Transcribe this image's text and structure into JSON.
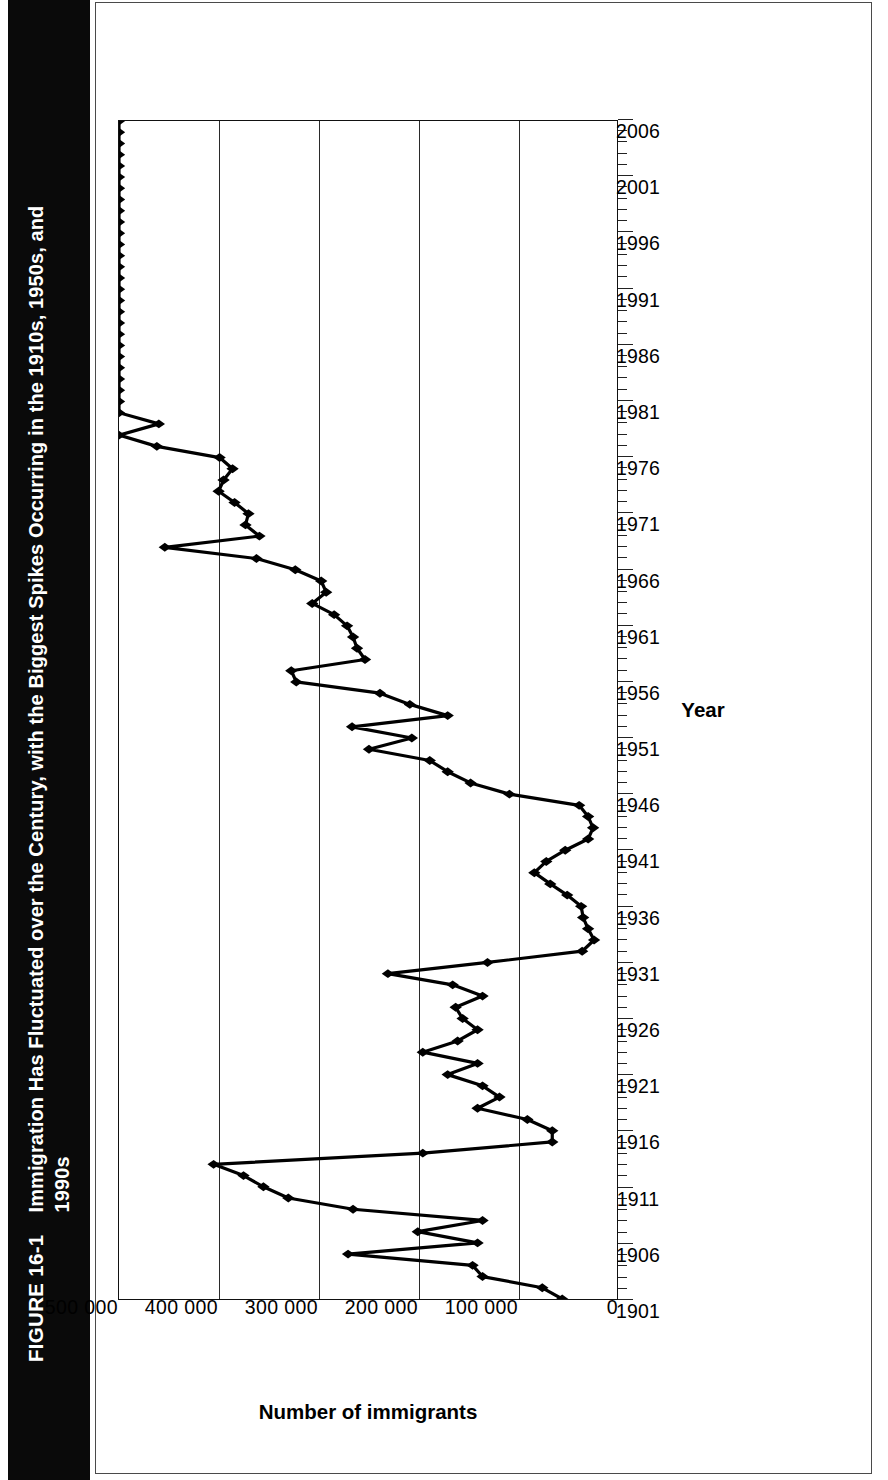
{
  "figure": {
    "number": "FIGURE 16-1",
    "title": "Immigration Has Fluctuated over the Century, with the Biggest Spikes Occurring in the 1910s, 1950s, and 1990s",
    "band_color": "#0a0a0a",
    "band_text_color": "#ffffff"
  },
  "chart_data": {
    "type": "line",
    "title": "Immigration Has Fluctuated over the Century, with the Biggest Spikes Occurring in the 1910s, 1950s, and 1990s",
    "xlabel": "Year",
    "ylabel": "Number of immigrants",
    "xlim": [
      1901,
      2006
    ],
    "ylim": [
      0,
      500000
    ],
    "grid": "horizontal-value-gridlines",
    "legend": "none",
    "marker": "filled-diamond",
    "line_color": "#000000",
    "y_ticks": [
      0,
      100000,
      200000,
      300000,
      400000,
      500000
    ],
    "y_tick_labels": [
      "0",
      "100 000",
      "200 000",
      "300 000",
      "400 000",
      "500 000"
    ],
    "x_tick_labels": [
      "1901",
      "1906",
      "1911",
      "1916",
      "1921",
      "1926",
      "1931",
      "1936",
      "1941",
      "1946",
      "1951",
      "1956",
      "1961",
      "1966",
      "1971",
      "1976",
      "1981",
      "1986",
      "1991",
      "1996",
      "2001",
      "2006"
    ],
    "x_tick_step": 5,
    "x_minor_tick_step": 1,
    "series": [
      {
        "name": "Number of immigrants",
        "x": [
          1901,
          1902,
          1903,
          1904,
          1905,
          1906,
          1907,
          1908,
          1909,
          1910,
          1911,
          1912,
          1913,
          1914,
          1915,
          1916,
          1917,
          1918,
          1919,
          1920,
          1921,
          1922,
          1923,
          1924,
          1925,
          1926,
          1927,
          1928,
          1929,
          1930,
          1931,
          1932,
          1933,
          1934,
          1935,
          1936,
          1937,
          1938,
          1939,
          1940,
          1941,
          1942,
          1943,
          1944,
          1945,
          1946,
          1947,
          1948,
          1949,
          1950,
          1951,
          1952,
          1953,
          1954,
          1955,
          1956,
          1957,
          1958,
          1959,
          1960,
          1961,
          1962,
          1963,
          1964,
          1965,
          1966,
          1967,
          1968,
          1969,
          1970,
          1971,
          1972,
          1973,
          1974,
          1975,
          1976,
          1977,
          1978,
          1979,
          1980,
          1981,
          1982,
          1983,
          1984,
          1985,
          1986,
          1987,
          1988,
          1989,
          1990,
          1991,
          1992,
          1993,
          1994,
          1995,
          1996,
          1997,
          1998,
          1999,
          2000,
          2001,
          2002,
          2003,
          2004,
          2005,
          2006
        ],
        "values": [
          55000,
          75000,
          135000,
          145000,
          270000,
          140000,
          200000,
          135000,
          265000,
          330000,
          355000,
          375000,
          405000,
          195000,
          65000,
          65000,
          90000,
          140000,
          118000,
          135000,
          170000,
          140000,
          195000,
          160000,
          140000,
          155000,
          162000,
          135000,
          165000,
          230000,
          130000,
          35000,
          23000,
          29000,
          34000,
          36000,
          50000,
          67000,
          83000,
          71000,
          52000,
          29000,
          24000,
          29000,
          38000,
          108000,
          147000,
          170000,
          188000,
          249000,
          206000,
          266000,
          170000,
          208000,
          238000,
          322000,
          327000,
          253000,
          261000,
          265000,
          271000,
          284000,
          306000,
          292000,
          297000,
          323000,
          362000,
          454000,
          359000,
          373000,
          370000,
          384000,
          400000,
          395000,
          386000,
          399000,
          462000,
          601000,
          460000,
          531000,
          597000,
          594000,
          560000,
          544000,
          570000,
          602000,
          602000,
          643000,
          1091000,
          1536000,
          1827000,
          974000,
          904000,
          804000,
          720000,
          916000,
          798000,
          654000,
          646000,
          850000,
          1064000,
          1064000,
          704000,
          958000,
          1122000,
          1266000
        ],
        "values_displayed_note": "Series plotted as drawn in the figure; plotted ordinate capped by the 500 000 axis."
      }
    ],
    "annotations": []
  }
}
